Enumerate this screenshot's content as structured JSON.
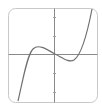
{
  "icon": {
    "name": "cubic-function-graph",
    "frame_color": "#c8c8c8",
    "axis_color": "#8a8a8a",
    "curve_color": "#707070",
    "tick_color": "#a0a0a0"
  }
}
